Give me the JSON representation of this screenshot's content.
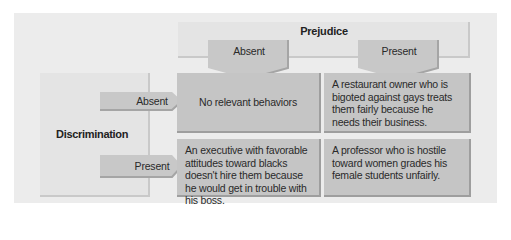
{
  "diagram": {
    "column_header": "Prejudice",
    "row_header": "Discrimination",
    "columns": [
      "Absent",
      "Present"
    ],
    "rows": [
      "Absent",
      "Present"
    ],
    "cells": [
      [
        "No relevant behaviors",
        "A restaurant owner who is bigoted against gays treats them fairly because he needs their business."
      ],
      [
        "An executive with favorable attitudes toward blacks doesn't hire them because he would get in trouble with his boss.",
        "A professor who is hostile toward women grades his female students unfairly."
      ]
    ],
    "colors": {
      "panel": "#ececec",
      "header_box": "#e4e4e4",
      "arrow": "#c8c8c8",
      "cell": "#c5c5c5",
      "cell_border": "#9e9e9e"
    }
  }
}
